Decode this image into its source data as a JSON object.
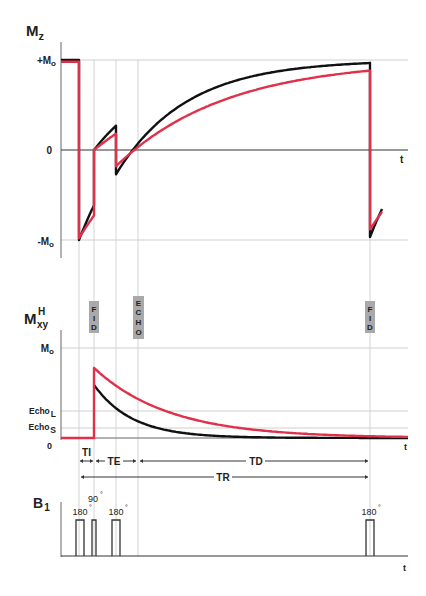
{
  "chart_data": {
    "type": "line",
    "colors": {
      "short_T1_T2": "#111111",
      "long_T1_T2": "#e0304a",
      "tag_background": "#a9a9a9"
    },
    "panels": {
      "mz": {
        "ylabel_main": "M",
        "ylabel_sub": "z",
        "ticks": {
          "plus": "+M",
          "plus_sub": "o",
          "zero": "0",
          "minus": "-M",
          "minus_sub": "o"
        },
        "xlabel": "t",
        "ylim": [
          -1,
          1
        ],
        "series": [
          {
            "name": "short",
            "description": "Mz, short T1 tissue (black)"
          },
          {
            "name": "long",
            "description": "Mz, long T1 tissue (red)"
          }
        ]
      },
      "mxy": {
        "ylabel_main": "M",
        "ylabel_sub": "xy",
        "ylabel_sup": "H",
        "ticks": {
          "mo": "M",
          "mo_sub": "o",
          "echo_l": "Echo",
          "echo_l_sub": "L",
          "echo_s": "Echo",
          "echo_s_sub": "S",
          "zero": "0"
        },
        "xlabel": "t",
        "levels": {
          "mo": 1.0,
          "echo_l": 0.3,
          "echo_s": 0.1
        },
        "series": [
          {
            "name": "short",
            "peak": 0.72
          },
          {
            "name": "long",
            "peak": 0.95
          }
        ]
      },
      "b1": {
        "ylabel_main": "B",
        "ylabel_sub": "1",
        "xlabel": "t",
        "pulses": [
          {
            "label": "180",
            "unit": "°"
          },
          {
            "label": "90",
            "unit": "°"
          },
          {
            "label": "180",
            "unit": "°"
          },
          {
            "label": "180",
            "unit": "°"
          }
        ]
      }
    },
    "tags": [
      {
        "name": "fid-tag-1",
        "letters": [
          "F",
          "I",
          "D"
        ]
      },
      {
        "name": "echo-tag",
        "letters": [
          "E",
          "C",
          "H",
          "O"
        ]
      },
      {
        "name": "fid-tag-2",
        "letters": [
          "F",
          "I",
          "D"
        ]
      }
    ],
    "intervals": {
      "ti": "TI",
      "te": "TE",
      "td": "TD",
      "tr": "TR"
    }
  }
}
